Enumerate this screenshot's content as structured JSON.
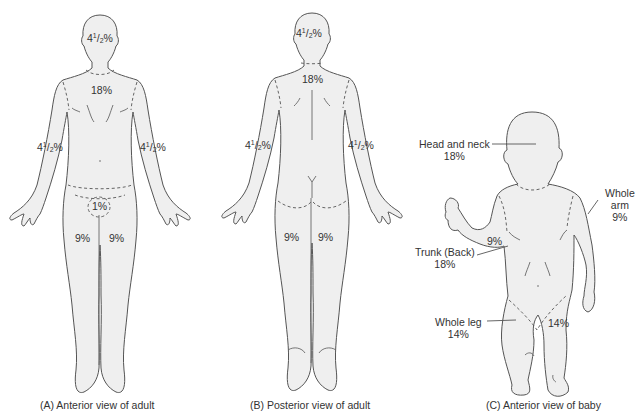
{
  "figure": {
    "panels": [
      {
        "id": "A",
        "caption": "(A) Anterior view of adult",
        "regions": {
          "head": {
            "whole": "4",
            "num": "1",
            "den": "2",
            "suffix": "%"
          },
          "trunk": "18%",
          "left_arm": {
            "whole": "4",
            "num": "1",
            "den": "2",
            "suffix": "%"
          },
          "right_arm": {
            "whole": "4",
            "num": "1",
            "den": "2",
            "suffix": "%"
          },
          "genitals": "1%",
          "left_leg": "9%",
          "right_leg": "9%"
        }
      },
      {
        "id": "B",
        "caption": "(B) Posterior view of adult",
        "regions": {
          "head": {
            "whole": "4",
            "num": "1",
            "den": "2",
            "suffix": "%"
          },
          "trunk": "18%",
          "left_arm": {
            "whole": "4",
            "num": "1",
            "den": "2",
            "suffix": "%"
          },
          "right_arm": {
            "whole": "4",
            "num": "1",
            "den": "2",
            "suffix": "%"
          },
          "left_leg": "9%",
          "right_leg": "9%"
        }
      },
      {
        "id": "C",
        "caption": "(C) Anterior view of baby",
        "regions": {
          "head_neck_label": "Head and neck",
          "head_neck_value": "18%",
          "arm_inline": "9%",
          "whole_arm_label_1": "Whole",
          "whole_arm_label_2": "arm",
          "whole_arm_value": "9%",
          "trunk_label": "Trunk (Back)",
          "trunk_value": "18%",
          "whole_leg_label": "Whole leg",
          "whole_leg_value": "14%",
          "leg_inline": "14%"
        }
      }
    ]
  }
}
